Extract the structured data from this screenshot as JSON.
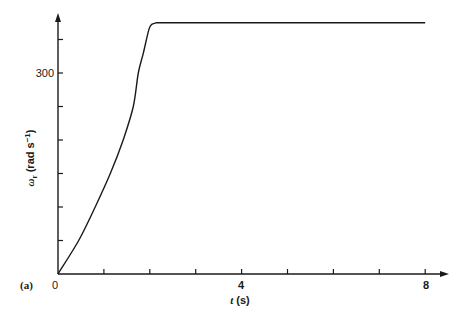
{
  "chart_data": {
    "type": "line",
    "title": "",
    "panel_label": "(a)",
    "xlabel": "t (s)",
    "ylabel": "ω_r (rad s⁻¹)",
    "ylabel_parts": {
      "symbol": "ω",
      "subscript": "r",
      "units": "(rad s",
      "exponent": "−1",
      "close": ")"
    },
    "xlabel_parts": {
      "symbol": "t",
      "units": "(s)"
    },
    "xlim": [
      0,
      8.5
    ],
    "ylim": [
      0,
      400
    ],
    "x_ticks": [
      0,
      1,
      2,
      3,
      4,
      5,
      6,
      7,
      8
    ],
    "x_tick_labels": [
      {
        "value": 0,
        "label": "0"
      },
      {
        "value": 4,
        "label": "4"
      },
      {
        "value": 8,
        "label": "8"
      }
    ],
    "y_ticks": [
      50,
      100,
      150,
      200,
      250,
      300,
      350
    ],
    "y_tick_labels": [
      {
        "value": 300,
        "label": "300"
      }
    ],
    "grid": false,
    "legend": null,
    "series": [
      {
        "name": "ω_r",
        "x": [
          0,
          0.45,
          0.81,
          1.14,
          1.42,
          1.64,
          1.75,
          1.86,
          1.98,
          2.05,
          2.15,
          8.0
        ],
        "y": [
          0,
          50,
          100,
          150,
          200,
          250,
          300,
          330,
          365,
          373,
          375,
          375
        ]
      }
    ]
  },
  "labels": {
    "panel": "(a)",
    "x_origin": "0",
    "x_4": "4",
    "x_8": "8",
    "y_300": "300",
    "x_axis_symbol": "t",
    "x_axis_units": " (s)",
    "y_axis_symbol": "ω",
    "y_axis_sub": "r",
    "y_axis_units": " (rad s",
    "y_axis_exp": "−1",
    "y_axis_close": ")"
  }
}
